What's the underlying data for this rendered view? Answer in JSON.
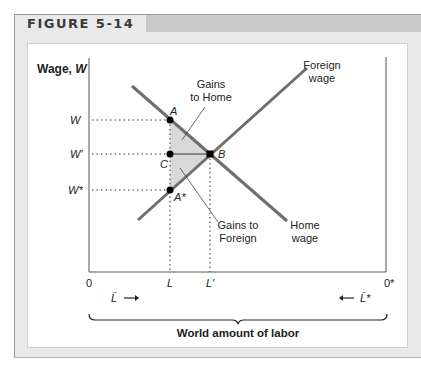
{
  "figure": {
    "label": "FIGURE 5-14"
  },
  "axes": {
    "y_label": "Wage, ",
    "y_label_var": "W",
    "origin_left": "0",
    "origin_right": "0*",
    "x_ticks": [
      {
        "label": "L",
        "x": 170
      },
      {
        "label": "L′",
        "x": 210
      }
    ],
    "y_ticks": [
      {
        "label": "W",
        "y": 120
      },
      {
        "label": "W′",
        "y": 154
      },
      {
        "label": "W*",
        "y": 190
      }
    ],
    "home_labor_label": "L̄",
    "foreign_labor_label": "L̄*",
    "brace_label": "World amount of labor"
  },
  "curves": {
    "home_wage": {
      "label_line1": "Home",
      "label_line2": "wage"
    },
    "foreign_wage": {
      "label_line1": "Foreign",
      "label_line2": "wage"
    }
  },
  "points": {
    "A": "A",
    "B": "B",
    "C": "C",
    "A_star": "A*"
  },
  "annotations": {
    "gains_home_line1": "Gains",
    "gains_home_line2": "to Home",
    "gains_foreign_line1": "Gains to",
    "gains_foreign_line2": "Foreign"
  },
  "colors": {
    "curve": "#6e6e6e",
    "shade": "#d9d9d9",
    "frame": "#e9e9e9",
    "header_band": "#c9c9c9"
  }
}
